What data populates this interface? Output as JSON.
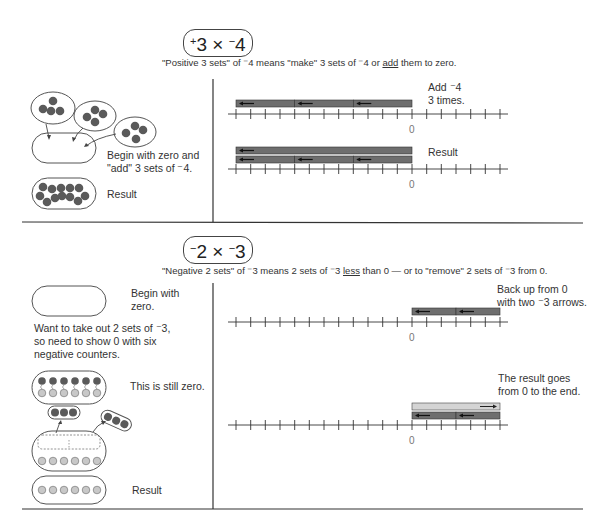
{
  "section1": {
    "title": "+3 × −4",
    "title_parts": {
      "sign1": "+",
      "num1": "3",
      "op": " × ",
      "sign2": "−",
      "num2": "4"
    },
    "subtitle_pre": "\"Positive 3 sets\" of ⁻4 means \"make\" 3 sets of ⁻4 or ",
    "subtitle_underlined": "add",
    "subtitle_post": " them to zero.",
    "left": {
      "begin_label_line1": "Begin with zero and",
      "begin_label_line2": "\"add\" 3 sets of ⁻4.",
      "result_label": "Result"
    },
    "right": {
      "step1_label_line1": "Add ⁻4",
      "step1_label_line2": "3 times.",
      "step2_label": "Result",
      "zero_label": "0"
    }
  },
  "section2": {
    "title": "−2 × −3",
    "subtitle_pre": "\"Negative 2 sets\" of ⁻3 means 2 sets of ⁻3 ",
    "subtitle_underlined": "less",
    "subtitle_post": " than 0 — or to \"remove\" 2 sets of ⁻3 from 0.",
    "left": {
      "begin_label_line1": "Begin with",
      "begin_label_line2": "zero.",
      "explain_line1": "Want to take out 2 sets of ⁻3,",
      "explain_line2": "so need to show 0 with six",
      "explain_line3": "negative counters.",
      "still_zero_label": "This is still zero.",
      "result_label": "Result"
    },
    "right": {
      "step1_label_line1": "Back up from 0",
      "step1_label_line2": "with two ⁻3 arrows.",
      "step2_label_line1": "The result goes",
      "step2_label_line2": "from 0 to the end.",
      "zero_label": "0"
    }
  },
  "colors": {
    "negative_counter": "#5a5a5a",
    "positive_counter": "#c8c8c8",
    "arrow_bar": "#6e6e6e",
    "result_bar_light": "#d4d4d4",
    "line": "#333333"
  }
}
